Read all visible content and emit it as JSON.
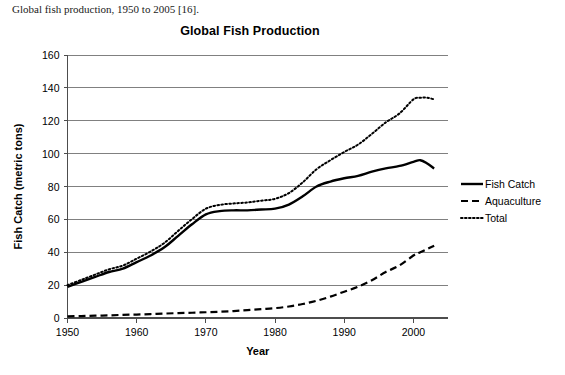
{
  "caption": "Global fish production, 1950 to 2005 [16].",
  "chart_data": {
    "type": "line",
    "title": "Global Fish Production",
    "xlabel": "Year",
    "ylabel": "Fish Catch (metric tons)",
    "xlim": [
      1950,
      2005
    ],
    "ylim": [
      0,
      160
    ],
    "xticks": [
      1950,
      1960,
      1970,
      1980,
      1990,
      2000
    ],
    "yticks": [
      0,
      20,
      40,
      60,
      80,
      100,
      120,
      140,
      160
    ],
    "grid": true,
    "legend_position": "right",
    "x": [
      1950,
      1952,
      1954,
      1956,
      1958,
      1960,
      1962,
      1964,
      1966,
      1968,
      1970,
      1972,
      1974,
      1976,
      1978,
      1980,
      1982,
      1984,
      1986,
      1988,
      1990,
      1992,
      1994,
      1996,
      1998,
      2000,
      2001,
      2002,
      2003
    ],
    "series": [
      {
        "name": "Fish Catch",
        "style": "solid",
        "color": "#000000",
        "values": [
          19,
          22,
          25,
          28,
          30,
          34,
          38,
          43,
          50,
          57,
          63,
          65,
          65.5,
          65.5,
          66,
          66.5,
          69,
          74,
          80,
          83,
          85,
          86.5,
          89,
          91,
          92.5,
          95,
          96,
          94,
          91
        ]
      },
      {
        "name": "Aquaculture",
        "style": "dashed",
        "color": "#000000",
        "values": [
          1,
          1.2,
          1.4,
          1.6,
          1.9,
          2.1,
          2.4,
          2.7,
          3,
          3.2,
          3.5,
          3.8,
          4.2,
          4.8,
          5.4,
          6,
          7,
          8.5,
          10.5,
          13,
          16,
          19,
          23,
          28,
          32,
          38,
          40,
          42,
          44
        ]
      },
      {
        "name": "Total",
        "style": "dotted",
        "color": "#000000",
        "values": [
          20,
          23.2,
          26.4,
          29.6,
          31.9,
          36.1,
          40.4,
          45.7,
          53,
          60.2,
          66.5,
          68.8,
          69.7,
          70.3,
          71.4,
          72.5,
          76,
          82.5,
          90.5,
          96,
          101,
          105.5,
          112,
          119,
          124.5,
          133,
          134,
          134,
          133
        ]
      }
    ]
  }
}
